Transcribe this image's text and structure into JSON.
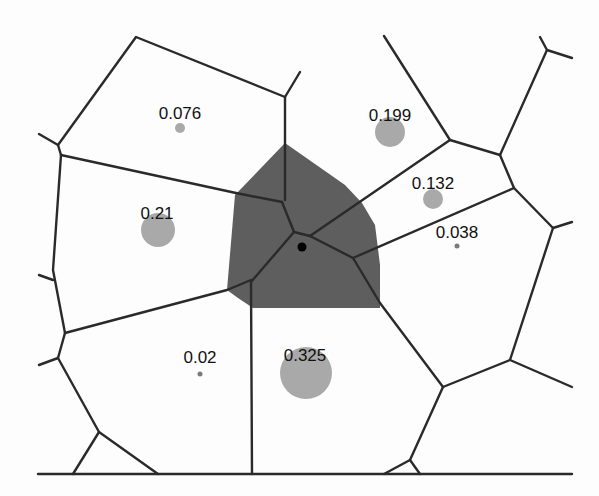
{
  "diagram": {
    "type": "weighted-voronoi",
    "highlighted_region_color": "#5e5e5e",
    "edge_color": "#2a2a2a",
    "circle_color": "#a9a9a9",
    "sites": [
      {
        "id": "s1",
        "label": "0.076",
        "x": 180,
        "y": 128,
        "r": 5
      },
      {
        "id": "s2",
        "label": "0.199",
        "x": 390,
        "y": 132,
        "r": 15
      },
      {
        "id": "s3",
        "label": "0.132",
        "x": 433,
        "y": 199,
        "r": 10
      },
      {
        "id": "s4",
        "label": "0.038",
        "x": 457,
        "y": 246,
        "r": 2.5
      },
      {
        "id": "s5",
        "label": "0.21",
        "x": 158,
        "y": 230,
        "r": 17
      },
      {
        "id": "s6",
        "label": "0.02",
        "x": 200,
        "y": 374,
        "r": 2.5
      },
      {
        "id": "s7",
        "label": "0.325",
        "x": 306,
        "y": 373,
        "r": 26
      }
    ],
    "query_point": {
      "x": 302,
      "y": 247
    }
  }
}
